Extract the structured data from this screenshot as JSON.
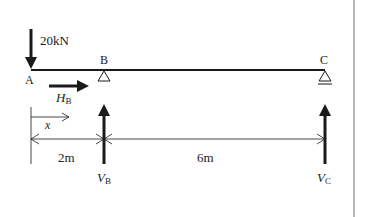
{
  "diagram": {
    "type": "beam free-body diagram",
    "points": {
      "a": "A",
      "b": "B",
      "c": "C"
    },
    "load": {
      "label": "20kN",
      "direction": "down",
      "at": "A"
    },
    "reactions": {
      "horizontal_b": {
        "symbol": "H",
        "subscript": "B",
        "direction": "right"
      },
      "vertical_b": {
        "symbol": "V",
        "subscript": "B",
        "direction": "up"
      },
      "vertical_c": {
        "symbol": "V",
        "subscript": "C",
        "direction": "up"
      }
    },
    "coordinate": {
      "label": "x",
      "direction": "right"
    },
    "dimensions": [
      {
        "label": "2m",
        "from": "A",
        "to": "B"
      },
      {
        "label": "6m",
        "from": "B",
        "to": "C"
      }
    ],
    "supports": {
      "b": "pin",
      "c": "roller"
    },
    "colors": {
      "ink": "#1a1a1a",
      "border": "#777777"
    }
  }
}
